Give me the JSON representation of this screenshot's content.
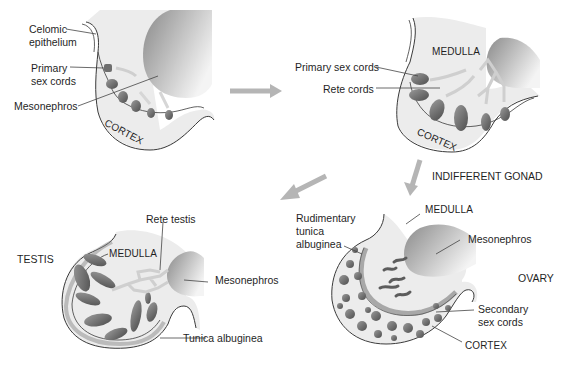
{
  "colors": {
    "tissue_fill": "#ececec",
    "tissue_stroke": "#3a3a3a",
    "mesonephros_dark": "#7a7a7a",
    "mesonephros_light": "#f2f2f2",
    "cord_fill": "#6e6e6e",
    "arrow": "#b5b5b5",
    "text": "#1f1f1f",
    "leader": "#444444"
  },
  "panels": {
    "stage1": {
      "labels": {
        "celomic_epithelium": [
          "Celomic",
          "epithelium"
        ],
        "primary_sex_cords": [
          "Primary",
          "sex cords"
        ],
        "mesonephros": "Mesonephros",
        "cortex": "CORTEX"
      }
    },
    "stage2": {
      "labels": {
        "medulla": "MEDULLA",
        "primary_sex_cords": "Primary sex cords",
        "rete_cords": "Rete cords",
        "cortex": "CORTEX"
      },
      "caption": "INDIFFERENT GONAD"
    },
    "testis": {
      "title": "TESTIS",
      "labels": {
        "rete_testis": "Rete testis",
        "medulla": "MEDULLA",
        "mesonephros": "Mesonephros",
        "tunica_albuginea": "Tunica albuginea"
      }
    },
    "ovary": {
      "title": "OVARY",
      "labels": {
        "rudimentary_tunica_albuginea": [
          "Rudimentary",
          "tunica",
          "albuginea"
        ],
        "medulla": "MEDULLA",
        "mesonephros": "Mesonephros",
        "secondary_sex_cords": [
          "Secondary",
          "sex cords"
        ],
        "cortex": "CORTEX"
      }
    }
  },
  "arrows": [
    {
      "name": "stage1-to-stage2",
      "direction": "right"
    },
    {
      "name": "stage2-to-ovary",
      "direction": "down"
    },
    {
      "name": "stage2-to-testis",
      "direction": "down-left"
    }
  ]
}
